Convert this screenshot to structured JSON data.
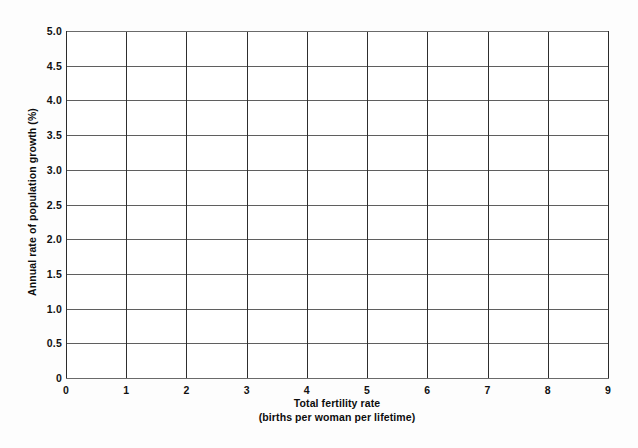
{
  "chart_data": {
    "type": "line",
    "title": "",
    "subtitle": "",
    "xlabel": "Total fertility rate",
    "xlabel_sub": "(births per woman per lifetime)",
    "ylabel": "Annual rate of population growth (%)",
    "xlim": [
      0,
      9
    ],
    "ylim": [
      0,
      5.0
    ],
    "xticks": [
      0,
      1,
      2,
      3,
      4,
      5,
      6,
      7,
      8,
      9
    ],
    "xtick_labels": [
      "0",
      "1",
      "2",
      "3",
      "4",
      "5",
      "6",
      "7",
      "8",
      "9"
    ],
    "yticks": [
      0,
      0.5,
      1.0,
      1.5,
      2.0,
      2.5,
      3.0,
      3.5,
      4.0,
      4.5,
      5.0
    ],
    "ytick_labels": [
      "0",
      "0.5",
      "1.0",
      "1.5",
      "2.0",
      "2.5",
      "3.0",
      "3.5",
      "4.0",
      "4.5",
      "5.0"
    ],
    "grid": true,
    "grid_axes": "both",
    "legend": false,
    "legend_position": "none",
    "series": [],
    "annotations": []
  },
  "style": {
    "background_color": "#fdfdfd",
    "plot_background_color": "#ffffff",
    "vertical_gridline_color": "#2e2e2e",
    "horizontal_gridline_color": "#5f5f5f",
    "axis_color": "#2b2b2b",
    "text_color": "#0d0d0d"
  }
}
